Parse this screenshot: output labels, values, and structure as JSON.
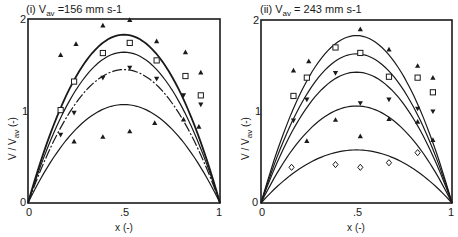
{
  "chart_data": [
    {
      "type": "line",
      "panel": "(i)",
      "title": "(i) V_av = 156 mm s-1",
      "title_parts": {
        "prefix": "(i)  V",
        "sub": "av",
        "suffix": " =156 mm s-1"
      },
      "xlabel": "x (-)",
      "ylabel": "V / V_av (-)",
      "ylabel_parts": {
        "prefix": "V / V",
        "sub": "av",
        "suffix": " (-)"
      },
      "xlim": [
        0,
        1
      ],
      "ylim": [
        0,
        2
      ],
      "xticks": [
        "0",
        ".5",
        "1"
      ],
      "yticks": [
        "0",
        "1",
        "2"
      ],
      "grid": false,
      "legend": "none",
      "curves": [
        {
          "name": "fit-1",
          "shape": "parabola",
          "peak": 1.83,
          "weight": "bold"
        },
        {
          "name": "fit-2",
          "shape": "parabola",
          "peak": 1.64,
          "weight": "normal"
        },
        {
          "name": "fit-3",
          "shape": "parabola",
          "peak": 1.45,
          "weight": "dashdot"
        },
        {
          "name": "fit-4",
          "shape": "parabola",
          "peak": 1.07,
          "weight": "normal"
        }
      ],
      "series": [
        {
          "name": "triangle-up-upper",
          "marker": "triangle-up",
          "x": [
            0.17,
            0.25,
            0.39,
            0.53,
            0.67,
            0.82,
            0.9
          ],
          "y": [
            1.61,
            1.73,
            1.93,
            1.99,
            1.76,
            1.64,
            1.42
          ]
        },
        {
          "name": "square",
          "marker": "square",
          "x": [
            0.17,
            0.24,
            0.39,
            0.53,
            0.67,
            0.82,
            0.9
          ],
          "y": [
            1.01,
            1.32,
            1.63,
            1.74,
            1.55,
            1.38,
            1.17
          ]
        },
        {
          "name": "triangle-down",
          "marker": "triangle-down",
          "x": [
            0.17,
            0.24,
            0.39,
            0.53,
            0.67,
            0.81,
            0.9
          ],
          "y": [
            0.74,
            0.98,
            1.36,
            1.47,
            1.35,
            1.17,
            1.07
          ]
        },
        {
          "name": "triangle-up-lower",
          "marker": "triangle-up-filled",
          "x": [
            0.24,
            0.39,
            0.53,
            0.66,
            0.81,
            0.89
          ],
          "y": [
            0.67,
            0.72,
            0.78,
            0.87,
            0.91,
            0.83
          ]
        }
      ]
    },
    {
      "type": "line",
      "panel": "(ii)",
      "title": "(ii) V_av = 243 mm s-1",
      "title_parts": {
        "prefix": "(ii)  V",
        "sub": "av",
        "suffix": " = 243 mm s-1"
      },
      "xlabel": "x (-)",
      "ylabel": "V / V_av (-)",
      "ylabel_parts": {
        "prefix": "V / V",
        "sub": "av",
        "suffix": " (-)"
      },
      "xlim": [
        0,
        1
      ],
      "ylim": [
        0,
        2
      ],
      "xticks": [
        "0",
        ".5",
        "1"
      ],
      "yticks": [
        "0",
        "1",
        "2"
      ],
      "grid": false,
      "legend": "none",
      "curves": [
        {
          "name": "fit-1",
          "shape": "parabola",
          "peak": 1.83,
          "weight": "normal"
        },
        {
          "name": "fit-2",
          "shape": "parabola",
          "peak": 1.63,
          "weight": "normal"
        },
        {
          "name": "fit-3",
          "shape": "parabola",
          "peak": 1.43,
          "weight": "normal"
        },
        {
          "name": "fit-4",
          "shape": "parabola",
          "peak": 1.06,
          "weight": "normal"
        },
        {
          "name": "fit-5",
          "shape": "parabola",
          "peak": 0.58,
          "weight": "normal"
        }
      ],
      "series": [
        {
          "name": "triangle-up-upper",
          "marker": "triangle-up",
          "x": [
            0.17,
            0.25,
            0.52,
            0.67,
            0.82,
            0.9
          ],
          "y": [
            1.45,
            1.55,
            1.9,
            1.68,
            1.5,
            1.37
          ]
        },
        {
          "name": "square",
          "marker": "square",
          "x": [
            0.17,
            0.24,
            0.39,
            0.52,
            0.67,
            0.82,
            0.9
          ],
          "y": [
            1.17,
            1.37,
            1.7,
            1.64,
            1.38,
            1.37,
            1.21
          ]
        },
        {
          "name": "triangle-down",
          "marker": "triangle-down",
          "x": [
            0.17,
            0.24,
            0.39,
            0.52,
            0.67,
            0.82,
            0.9
          ],
          "y": [
            0.9,
            1.13,
            1.42,
            1.09,
            1.13,
            1.03,
            1.0
          ]
        },
        {
          "name": "triangle-up-filled",
          "marker": "triangle-up-filled",
          "x": [
            0.24,
            0.39,
            0.52,
            0.67,
            0.82,
            0.9
          ],
          "y": [
            0.68,
            0.91,
            0.73,
            0.92,
            0.89,
            0.69
          ]
        },
        {
          "name": "diamond",
          "marker": "diamond",
          "x": [
            0.16,
            0.39,
            0.52,
            0.67,
            0.82
          ],
          "y": [
            0.39,
            0.42,
            0.39,
            0.44,
            0.55
          ]
        }
      ]
    }
  ]
}
